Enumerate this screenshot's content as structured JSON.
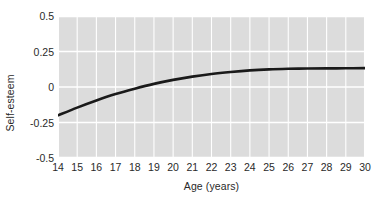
{
  "chart_data": {
    "type": "line",
    "title": "",
    "xlabel": "Age (years)",
    "ylabel": "Self-esteem",
    "xlim": [
      14,
      30
    ],
    "ylim": [
      -0.5,
      0.5
    ],
    "grid": true,
    "legend_position": "none",
    "xticks": [
      "14",
      "15",
      "16",
      "17",
      "18",
      "19",
      "20",
      "21",
      "22",
      "23",
      "24",
      "25",
      "26",
      "27",
      "28",
      "29",
      "30"
    ],
    "yticks": [
      "0.5",
      "0.25",
      "0",
      "-0.25",
      "-0.5"
    ],
    "xtick_values": [
      14,
      15,
      16,
      17,
      18,
      19,
      20,
      21,
      22,
      23,
      24,
      25,
      26,
      27,
      28,
      29,
      30
    ],
    "ytick_values": [
      0.5,
      0.25,
      0,
      -0.25,
      -0.5
    ],
    "series": [
      {
        "name": "Self-esteem",
        "color": "#1a1a1a",
        "line_width": 2.6,
        "x": [
          14,
          15,
          16,
          17,
          18,
          19,
          20,
          21,
          22,
          23,
          24,
          25,
          26,
          27,
          28,
          29,
          30
        ],
        "values": [
          -0.2,
          -0.145,
          -0.095,
          -0.05,
          -0.012,
          0.022,
          0.05,
          0.073,
          0.092,
          0.106,
          0.117,
          0.124,
          0.128,
          0.13,
          0.131,
          0.132,
          0.133
        ]
      }
    ],
    "annotations": [],
    "plot_bg_color": "#dcdcdc",
    "grid_color": "#ffffff",
    "figure_bg_color": "#ffffff"
  }
}
